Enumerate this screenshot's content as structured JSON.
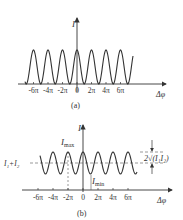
{
  "figure_a": {
    "caption": "(a)",
    "y_label": "I",
    "x_label": "Δφ",
    "tick_labels": [
      "-6π",
      "-4π",
      "-2π",
      "0",
      "2π",
      "4π",
      "6π"
    ],
    "description": "I = 4I₁cos²(Δφ/2), oscillating between 0 and max"
  },
  "figure_b": {
    "caption": "(b)",
    "y_label": "I",
    "x_label": "Δφ",
    "tick_labels": [
      "-6π",
      "-4π",
      "-2π",
      "0",
      "2π",
      "4π",
      "6π"
    ],
    "max_label": "I",
    "max_sub": "max",
    "min_label": "I",
    "min_sub": "min",
    "mean_label": "I₁+I₂",
    "amplitude_label": "2√(I₁I₂)"
  },
  "colors": {
    "line": "#333333",
    "dashed": "#555555"
  }
}
